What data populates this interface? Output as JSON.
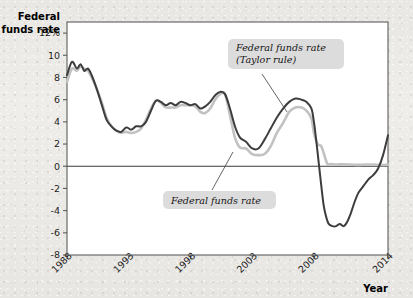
{
  "chart_data": {
    "type": "line",
    "title": "",
    "xlabel": "Year",
    "ylabel": "Federal funds rate",
    "ylabel_line1": "Federal",
    "ylabel_line2": "funds rate",
    "xlim": [
      1988,
      2014
    ],
    "ylim": [
      -8,
      13
    ],
    "grid": false,
    "legend_position": "annotations-inline",
    "y_ticks": [
      12,
      10,
      8,
      6,
      4,
      2,
      0,
      -2,
      -4,
      -6,
      -8
    ],
    "y_tick_labels": [
      "12%",
      "10",
      "8",
      "6",
      "4",
      "2",
      "0",
      "-2",
      "-4",
      "-6",
      "-8"
    ],
    "x_ticks": [
      1988,
      1993,
      1998,
      2003,
      2008,
      2014
    ],
    "x_tick_labels": [
      "1988",
      "1993",
      "1998",
      "2003",
      "2008",
      "2014"
    ],
    "zero_reference_line": 0,
    "colors": {
      "taylor_rule": "#3d3d3d",
      "actual": "#c2c2c2",
      "axis": "#5d5d5d",
      "plot_background": "#ffffff",
      "page_background": "#eceae6",
      "callout_background": "#dcdcdc"
    },
    "annotations": [
      {
        "name": "taylor-rule-label",
        "line1": "Federal funds rate",
        "line2": "(Taylor rule)",
        "points_to_series": "Federal funds rate (Taylor rule)"
      },
      {
        "name": "actual-label",
        "line1": "Federal funds rate",
        "line2": "",
        "points_to_series": "Federal funds rate"
      }
    ],
    "series": [
      {
        "name": "Federal funds rate (Taylor rule)",
        "color": "#3d3d3d",
        "x": [
          1988.0,
          1988.4,
          1988.8,
          1989.1,
          1989.4,
          1989.7,
          1990.0,
          1990.4,
          1990.8,
          1991.2,
          1991.6,
          1992.0,
          1992.4,
          1992.8,
          1993.2,
          1993.6,
          1994.0,
          1994.4,
          1994.8,
          1995.2,
          1995.6,
          1996.0,
          1996.4,
          1996.8,
          1997.2,
          1997.6,
          1998.0,
          1998.4,
          1998.8,
          1999.2,
          1999.6,
          2000.0,
          2000.4,
          2000.8,
          2001.2,
          2001.6,
          2002.0,
          2002.5,
          2003.0,
          2003.5,
          2004.0,
          2004.5,
          2005.0,
          2005.5,
          2006.0,
          2006.5,
          2007.0,
          2007.4,
          2007.8,
          2008.0,
          2008.2,
          2008.4,
          2008.6,
          2008.8,
          2009.0,
          2009.2,
          2009.5,
          2009.8,
          2010.1,
          2010.4,
          2010.7,
          2011.0,
          2011.3,
          2011.6,
          2012.0,
          2012.4,
          2012.8,
          2013.2,
          2013.6,
          2014.0
        ],
        "y": [
          8.2,
          9.4,
          8.8,
          9.2,
          8.6,
          8.8,
          8.2,
          7.0,
          5.6,
          4.2,
          3.6,
          3.2,
          3.1,
          3.5,
          3.3,
          3.6,
          3.6,
          4.0,
          5.0,
          5.9,
          5.8,
          5.5,
          5.7,
          5.5,
          5.8,
          5.7,
          5.5,
          5.6,
          5.2,
          5.4,
          5.8,
          6.4,
          6.7,
          6.5,
          5.2,
          3.6,
          2.6,
          2.2,
          1.6,
          1.6,
          2.4,
          3.4,
          4.4,
          5.2,
          5.8,
          6.1,
          6.0,
          5.8,
          5.2,
          4.0,
          2.2,
          0.2,
          -1.8,
          -3.6,
          -4.6,
          -5.2,
          -5.4,
          -5.4,
          -5.2,
          -5.4,
          -5.0,
          -4.2,
          -3.2,
          -2.4,
          -1.8,
          -1.2,
          -0.8,
          -0.2,
          1.0,
          2.8
        ]
      },
      {
        "name": "Federal funds rate",
        "color": "#c2c2c2",
        "x": [
          1988.0,
          1988.4,
          1988.8,
          1989.1,
          1989.4,
          1989.7,
          1990.0,
          1990.4,
          1990.8,
          1991.2,
          1991.6,
          1992.0,
          1992.4,
          1992.8,
          1993.2,
          1993.6,
          1994.0,
          1994.4,
          1994.8,
          1995.2,
          1995.6,
          1996.0,
          1996.4,
          1996.8,
          1997.2,
          1997.6,
          1998.0,
          1998.4,
          1998.8,
          1999.2,
          1999.6,
          2000.0,
          2000.4,
          2000.8,
          2001.2,
          2001.6,
          2002.0,
          2002.5,
          2003.0,
          2003.5,
          2004.0,
          2004.5,
          2005.0,
          2005.5,
          2006.0,
          2006.5,
          2007.0,
          2007.4,
          2007.8,
          2008.0,
          2008.3,
          2008.6,
          2008.9,
          2009.1,
          2009.4,
          2009.8,
          2010.4,
          2011.0,
          2011.6,
          2012.2,
          2012.8,
          2013.4,
          2014.0
        ],
        "y": [
          7.6,
          8.8,
          8.6,
          9.0,
          8.8,
          8.6,
          8.0,
          7.0,
          5.8,
          4.4,
          3.6,
          3.2,
          3.0,
          3.1,
          3.0,
          3.1,
          3.4,
          4.2,
          5.2,
          5.9,
          5.7,
          5.3,
          5.3,
          5.3,
          5.5,
          5.5,
          5.5,
          5.4,
          4.9,
          4.8,
          5.2,
          6.0,
          6.5,
          6.5,
          4.6,
          2.6,
          1.7,
          1.6,
          1.1,
          1.0,
          1.1,
          1.8,
          3.0,
          3.9,
          4.9,
          5.3,
          5.3,
          5.0,
          4.3,
          3.0,
          2.0,
          1.8,
          0.8,
          0.2,
          0.2,
          0.15,
          0.18,
          0.15,
          0.12,
          0.15,
          0.15,
          0.12,
          0.12
        ]
      }
    ]
  },
  "axes": {
    "y_axis_title_line1": "Federal",
    "y_axis_title_line2": "funds rate",
    "x_axis_title": "Year"
  }
}
